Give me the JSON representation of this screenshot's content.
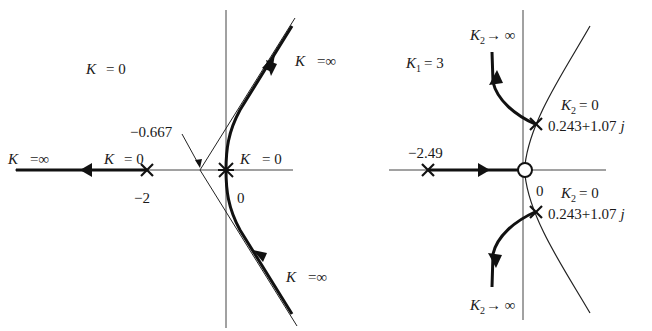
{
  "figure": {
    "type": "root-locus",
    "panels": [
      {
        "id": "left",
        "labels": {
          "k_zero_top": {
            "var": "K",
            "eq": "= 0"
          },
          "k_inf_left": {
            "var": "K",
            "eq": "=∞"
          },
          "k_zero_pole": {
            "var": "K",
            "eq": "= 0"
          },
          "k_zero_origin": {
            "var": "K",
            "eq": "= 0"
          },
          "k_inf_upper": {
            "var": "K",
            "eq": "=∞"
          },
          "k_inf_lower": {
            "var": "K",
            "eq": "=∞"
          },
          "centroid": "−0.667",
          "pole_tick": "−2",
          "origin_tick": "0"
        },
        "poles": [
          -2,
          0,
          0,
          0
        ],
        "centroid": -0.667
      },
      {
        "id": "right",
        "labels": {
          "k1": {
            "var": "K",
            "sub": "1",
            "eq": "= 3"
          },
          "k2_inf_top": {
            "var": "K",
            "sub": "2",
            "eq": "→ ∞"
          },
          "k2_inf_bottom": {
            "var": "K",
            "sub": "2",
            "eq": "→ ∞"
          },
          "k2_zero_upper": {
            "var": "K",
            "sub": "2",
            "eq": "= 0"
          },
          "k2_zero_lower": {
            "var": "K",
            "sub": "2",
            "eq": "= 0"
          },
          "pole_upper_value": "0.243+1.07",
          "pole_lower_value": "0.243+1.07",
          "j_unit": "j",
          "real_pole": "−2.49",
          "origin_tick": "0"
        },
        "poles": [
          "-2.49",
          "0.243+1.07j",
          "0.243-1.07j"
        ],
        "zeros": [
          0
        ]
      }
    ]
  }
}
